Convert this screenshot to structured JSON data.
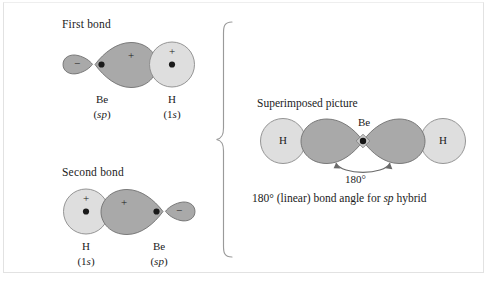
{
  "figure": {
    "title_first_bond": "First bond",
    "title_second_bond": "Second bond",
    "title_superimposed": "Superimposed picture",
    "caption": "180° (linear) bond angle for sp hybrid",
    "caption_parts": {
      "before": "180° (linear) bond angle for ",
      "italic": "sp",
      "after": " hybrid"
    },
    "angle_label": "180°"
  },
  "colors": {
    "lobe_fill": "#a9a9a9",
    "lobe_stroke": "#6f6f6f",
    "hydrogen_fill": "#dedede",
    "hydrogen_stroke": "#8a8a8a",
    "nucleus_dot": "#1a1a1a",
    "text": "#1b1b1b",
    "frame": "#e2e2e2",
    "brace": "#9a9a9a",
    "arrow": "#6a6a6a"
  },
  "first_bond": {
    "heading": "First bond",
    "be": {
      "element": "Be",
      "orbital": "(sp)",
      "orbital_parts": {
        "open": "(",
        "italic": "sp",
        "close": ")"
      },
      "small_lobe_sign": "−",
      "large_lobe_sign": "+",
      "has_nucleus_dot": true
    },
    "h": {
      "element": "H",
      "orbital": "(1s)",
      "orbital_parts": {
        "open": "(1",
        "italic": "s",
        "close": ")"
      },
      "sign": "+",
      "has_nucleus_dot": true
    }
  },
  "second_bond": {
    "heading": "Second bond",
    "h": {
      "element": "H",
      "orbital": "(1s)",
      "orbital_parts": {
        "open": "(1",
        "italic": "s",
        "close": ")"
      },
      "sign": "+",
      "has_nucleus_dot": true
    },
    "be": {
      "element": "Be",
      "orbital": "(sp)",
      "orbital_parts": {
        "open": "(",
        "italic": "sp",
        "close": ")"
      },
      "small_lobe_sign": "−",
      "large_lobe_sign": "+",
      "has_nucleus_dot": true
    }
  },
  "superimposed": {
    "heading": "Superimposed picture",
    "center_atom": "Be",
    "left_atom": "H",
    "right_atom": "H",
    "angle": "180°",
    "caption": "180° (linear) bond angle for sp hybrid"
  }
}
